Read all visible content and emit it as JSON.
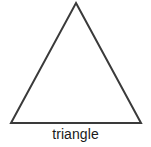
{
  "figure": {
    "kind": "geometric-shape-diagram",
    "background_color": "#ffffff",
    "width": 151,
    "height": 147,
    "label": "triangle",
    "label_color": "#1a1a1a",
    "shape": {
      "name": "triangle",
      "variant": "isosceles",
      "fill": "none",
      "stroke_color": "#3a3a3a",
      "stroke_width": 2,
      "points": "76,3 141,123 11,123",
      "vertices": {
        "apex": "76,3",
        "bottom_left": "11,123",
        "bottom_right": "141,123"
      }
    }
  }
}
